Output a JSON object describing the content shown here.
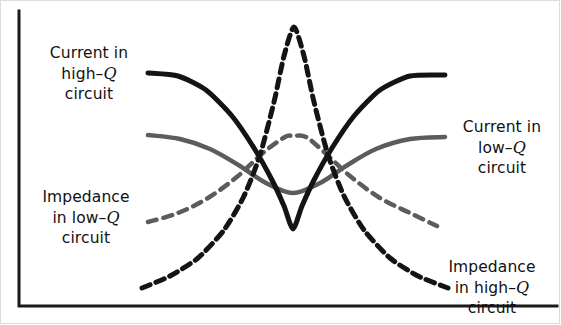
{
  "figure": {
    "background_color": "#ffffff",
    "width": 561,
    "height": 325
  },
  "axes": {
    "color": "#1a1a1a",
    "stroke_width": 3,
    "y_axis": {
      "x": 19,
      "y_top": 11,
      "y_bottom": 306
    },
    "x_axis": {
      "y": 306,
      "x_left": 19,
      "x_right": 557
    },
    "x_tick_labels": [],
    "y_tick_labels": [],
    "grid": false
  },
  "labels": {
    "current_high_q": {
      "line1": "Current in",
      "line2_pre": "high",
      "line2_dash": "–",
      "line2_var": "Q",
      "line3": "circuit"
    },
    "current_low_q": {
      "line1": "Current in",
      "line2_pre": "low",
      "line2_dash": "–",
      "line2_var": "Q",
      "line3": "circuit"
    },
    "impedance_low_q": {
      "line1": "Impedance",
      "line2_pre": "in low",
      "line2_dash": "–",
      "line2_var": "Q",
      "line3": "circuit"
    },
    "impedance_high_q": {
      "line1": "Impedance",
      "line2_pre": "in high",
      "line2_dash": "–",
      "line2_var": "Q",
      "line3": "circuit"
    }
  },
  "chart_data": {
    "type": "line",
    "xlabel": "",
    "ylabel": "",
    "grid": false,
    "legend_position": "inline-annotations",
    "xlim": [
      0,
      561
    ],
    "ylim": [
      325,
      0
    ],
    "axis_note": "Unlabeled qualitative axes: horizontal = frequency, vertical = current / impedance magnitude",
    "series": [
      {
        "name": "Current in high-Q circuit",
        "style": "solid",
        "color": "#141414",
        "stroke_width": 5,
        "shape": "deep sharp V-shaped minimum at resonance, high on both flanks",
        "points": [
          [
            148,
            73
          ],
          [
            178,
            76
          ],
          [
            206,
            90
          ],
          [
            232,
            116
          ],
          [
            254,
            148
          ],
          [
            272,
            180
          ],
          [
            284,
            206
          ],
          [
            293,
            229
          ],
          [
            302,
            206
          ],
          [
            314,
            180
          ],
          [
            332,
            148
          ],
          [
            354,
            116
          ],
          [
            380,
            90
          ],
          [
            410,
            76
          ],
          [
            445,
            75
          ]
        ]
      },
      {
        "name": "Impedance in high-Q circuit",
        "style": "dashed",
        "color": "#141414",
        "stroke_width": 5,
        "dash_pattern": [
          9,
          6
        ],
        "shape": "tall narrow sharp peak at resonance, low on both flanks",
        "points": [
          [
            142,
            288
          ],
          [
            170,
            276
          ],
          [
            198,
            258
          ],
          [
            224,
            230
          ],
          [
            244,
            196
          ],
          [
            260,
            155
          ],
          [
            274,
            102
          ],
          [
            284,
            56
          ],
          [
            294,
            27
          ],
          [
            304,
            56
          ],
          [
            314,
            102
          ],
          [
            328,
            155
          ],
          [
            344,
            196
          ],
          [
            364,
            230
          ],
          [
            390,
            258
          ],
          [
            418,
            276
          ],
          [
            448,
            288
          ]
        ]
      },
      {
        "name": "Current in low-Q circuit",
        "style": "solid",
        "color": "#5c5c5c",
        "stroke_width": 4.5,
        "shape": "broad shallow minimum at resonance",
        "points": [
          [
            148,
            135
          ],
          [
            180,
            139
          ],
          [
            210,
            149
          ],
          [
            240,
            166
          ],
          [
            266,
            183
          ],
          [
            293,
            193
          ],
          [
            320,
            183
          ],
          [
            346,
            166
          ],
          [
            376,
            149
          ],
          [
            410,
            139
          ],
          [
            445,
            137
          ]
        ]
      },
      {
        "name": "Impedance in low-Q circuit",
        "style": "dashed",
        "color": "#5c5c5c",
        "stroke_width": 4.5,
        "dash_pattern": [
          9,
          7
        ],
        "shape": "broad shallow peak at resonance",
        "points": [
          [
            148,
            222
          ],
          [
            178,
            213
          ],
          [
            208,
            198
          ],
          [
            238,
            176
          ],
          [
            264,
            152
          ],
          [
            285,
            137
          ],
          [
            293,
            136
          ],
          [
            306,
            137
          ],
          [
            324,
            152
          ],
          [
            350,
            176
          ],
          [
            380,
            198
          ],
          [
            410,
            213
          ],
          [
            437,
            226
          ]
        ]
      }
    ]
  }
}
